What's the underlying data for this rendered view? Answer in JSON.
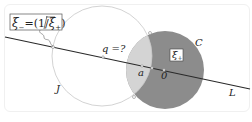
{
  "diagram": {
    "labels": {
      "xi_minus_box": "ξ₋=(1/ξ̄₊)",
      "xi_minus_lhs": "ξ",
      "xi_minus_sub": "−",
      "xi_minus_rhs": "=(1/",
      "xi_minus_bar": "ξ",
      "xi_minus_bar_sub": "+",
      "xi_minus_close": ")",
      "xi_plus_box": "ξ",
      "xi_plus_sub": "+",
      "q": "q =?",
      "a": "a",
      "zero": "0",
      "circle_c": "C",
      "circle_j": "J",
      "line_l": "L"
    },
    "colors": {
      "circle_c_fill": "#8c8c8c",
      "lens_fill": "#d4d4d4",
      "circle_j_stroke": "#c8c8c8",
      "line_stroke": "#2a2a2a",
      "background": "#ffffff"
    }
  }
}
